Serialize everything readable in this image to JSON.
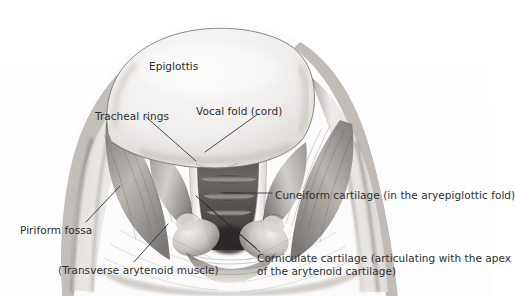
{
  "figure": {
    "style": "grayscale pencil / graphite anatomical illustration",
    "background_color": "#ffffff",
    "text_color": "#2e2e2e",
    "line_color": "#2b2b2b"
  },
  "labels": [
    {
      "id": "epiglottis",
      "text": "Epiglottis",
      "x": 149,
      "y": 60,
      "has_leader_line": false
    },
    {
      "id": "tracheal-rings",
      "text": "Tracheal rings",
      "x": 95,
      "y": 110,
      "has_leader_line": true
    },
    {
      "id": "vocal-fold",
      "text": "Vocal fold (cord)",
      "x": 196,
      "y": 105,
      "has_leader_line": true
    },
    {
      "id": "cuneiform-cartilage",
      "text": "Cuneiform cartilage (in the aryepiglottic fold)",
      "x": 275,
      "y": 189,
      "has_leader_line": true
    },
    {
      "id": "piriform-fossa",
      "text": "Piriform fossa",
      "x": 20,
      "y": 224,
      "has_leader_line": true
    },
    {
      "id": "corniculate-cartilage",
      "text": "Corniculate cartilage (articulating with the apex\nof the arytenoid cartilage)",
      "x": 257,
      "y": 252,
      "has_leader_line": true
    },
    {
      "id": "transverse-arytenoid-muscle",
      "text": "(Transverse arytenoid muscle)",
      "x": 58,
      "y": 264,
      "has_leader_line": true
    }
  ]
}
